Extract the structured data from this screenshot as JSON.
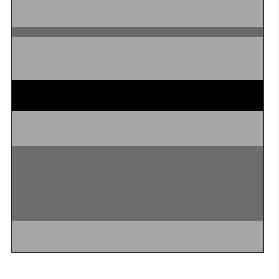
{
  "figure": {
    "frame": {
      "left": 11,
      "top": 0,
      "width": 251,
      "height": 252,
      "border_color": "#2a2a2a"
    },
    "bands": [
      {
        "name": "light-band-1",
        "top": 0,
        "height": 27,
        "color": "#a7a7a7"
      },
      {
        "name": "dark-stripe",
        "top": 27,
        "height": 10,
        "color": "#6a6a6a"
      },
      {
        "name": "light-band-2",
        "top": 37,
        "height": 43,
        "color": "#a7a7a7"
      },
      {
        "name": "black-band",
        "top": 80,
        "height": 31,
        "color": "#000000"
      },
      {
        "name": "light-band-3",
        "top": 111,
        "height": 35,
        "color": "#a7a7a7"
      },
      {
        "name": "dark-band",
        "top": 146,
        "height": 75,
        "color": "#6d6d6d"
      },
      {
        "name": "light-band-4",
        "top": 221,
        "height": 31,
        "color": "#a7a7a7"
      }
    ]
  }
}
